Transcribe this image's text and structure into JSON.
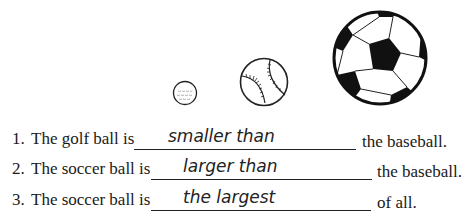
{
  "images": [
    {
      "name": "golf ball",
      "size": "small"
    },
    {
      "name": "baseball",
      "size": "medium"
    },
    {
      "name": "soccer ball",
      "size": "large"
    }
  ],
  "questions": [
    {
      "number": "1.",
      "prefix": "The golf ball is",
      "answer": "smaller than",
      "suffix": "the baseball."
    },
    {
      "number": "2.",
      "prefix": "The soccer ball is",
      "answer": "larger than",
      "suffix": "the baseball."
    },
    {
      "number": "3.",
      "prefix": "The soccer ball is",
      "answer": "the largest",
      "suffix": "of all."
    }
  ]
}
